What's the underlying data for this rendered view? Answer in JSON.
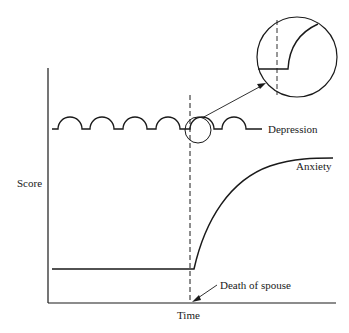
{
  "diagram": {
    "axes": {
      "y_label": "Score",
      "x_label": "Time"
    },
    "curves": {
      "depression_label": "Depression",
      "anxiety_label": "Anxiety"
    },
    "event": {
      "label": "Death of spouse"
    },
    "inset": {
      "description": "Magnified view of depression curve at event"
    },
    "colors": {
      "ink": "#1a1a1a",
      "background": "#ffffff"
    }
  }
}
